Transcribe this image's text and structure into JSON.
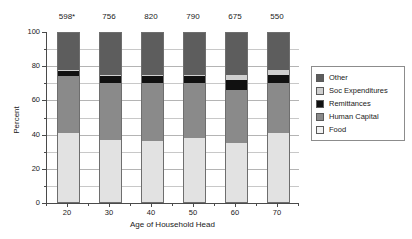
{
  "chart_data": {
    "type": "bar",
    "subtype": "stacked",
    "title": "",
    "xlabel": "Age of Household Head",
    "ylabel": "Percent",
    "categories": [
      "20",
      "30",
      "40",
      "50",
      "60",
      "70"
    ],
    "xlim": [
      15,
      75
    ],
    "ylim": [
      0,
      100
    ],
    "ytick_labels": [
      "0",
      "20",
      "40",
      "60",
      "80",
      "100"
    ],
    "ytick_values": [
      0,
      20,
      40,
      60,
      80,
      100
    ],
    "yminor_values": [
      10,
      30,
      50,
      70,
      90
    ],
    "grid": true,
    "legend_position": "right",
    "column_annotations": [
      "598*",
      "756",
      "820",
      "790",
      "675",
      "550"
    ],
    "series": [
      {
        "name": "Food",
        "color": "#e2e2e2",
        "values": [
          41,
          37,
          36,
          38,
          35,
          41
        ]
      },
      {
        "name": "Human Capital",
        "color": "#8a8a8a",
        "values": [
          33,
          33,
          34,
          32,
          31,
          29
        ]
      },
      {
        "name": "Remittances",
        "color": "#111111",
        "values": [
          3,
          4,
          4,
          4,
          6,
          5
        ]
      },
      {
        "name": "Soc Expenditures",
        "color": "#cfcfcf",
        "values": [
          1,
          1,
          1,
          1,
          3,
          3
        ]
      },
      {
        "name": "Other",
        "color": "#5d5d5d",
        "values": [
          22,
          25,
          25,
          25,
          25,
          22
        ]
      }
    ],
    "legend_order": [
      "Other",
      "Soc Expenditures",
      "Remittances",
      "Human Capital",
      "Food"
    ]
  },
  "legend": {
    "items": [
      {
        "label": "Other",
        "color": "#5d5d5d",
        "icon": "legend-swatch-icon"
      },
      {
        "label": "Soc Expenditures",
        "color": "#cfcfcf",
        "icon": "legend-swatch-icon"
      },
      {
        "label": "Remittances",
        "color": "#111111",
        "icon": "legend-swatch-icon"
      },
      {
        "label": "Human Capital",
        "color": "#8a8a8a",
        "icon": "legend-swatch-icon"
      },
      {
        "label": "Food",
        "color": "#f2f2f2",
        "icon": "legend-swatch-icon"
      }
    ]
  }
}
